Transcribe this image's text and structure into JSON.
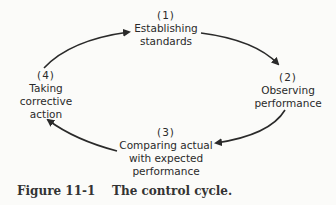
{
  "diagram": {
    "type": "cycle",
    "nodes": [
      {
        "number": "(1)",
        "lines": [
          "Establishing",
          "standards"
        ]
      },
      {
        "number": "(2)",
        "lines": [
          "Observing",
          "performance"
        ]
      },
      {
        "number": "(3)",
        "lines": [
          "Comparing actual",
          "with expected",
          "performance"
        ]
      },
      {
        "number": "(4)",
        "lines": [
          "Taking",
          "corrective",
          "action"
        ]
      }
    ],
    "edges": [
      {
        "from": "(1)",
        "to": "(2)"
      },
      {
        "from": "(2)",
        "to": "(3)"
      },
      {
        "from": "(3)",
        "to": "(4)"
      },
      {
        "from": "(4)",
        "to": "(1)"
      }
    ]
  },
  "caption": {
    "label": "Figure 11-1",
    "text": "The control cycle."
  }
}
